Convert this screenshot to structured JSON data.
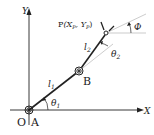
{
  "diagram": {
    "axes": {
      "x_label": "X",
      "y_label": "Y",
      "origin_label": "O"
    },
    "joints": [
      {
        "name": "A",
        "label": "A"
      },
      {
        "name": "B",
        "label": "B"
      }
    ],
    "end_effector": {
      "label": "P",
      "coords_label": "(X",
      "xp_sub": "P",
      "sep": ", Y",
      "yp_sub": "P",
      "close": ")"
    },
    "links": [
      {
        "name": "l1",
        "label": "l",
        "sub": "1"
      },
      {
        "name": "l2",
        "label": "l",
        "sub": "2"
      }
    ],
    "angles": [
      {
        "name": "theta1",
        "label": "θ",
        "sub": "1"
      },
      {
        "name": "theta2",
        "label": "θ",
        "sub": "2"
      },
      {
        "name": "phi",
        "label": "Φ"
      }
    ],
    "colors": {
      "line": "#222222",
      "guide": "#999999"
    }
  }
}
